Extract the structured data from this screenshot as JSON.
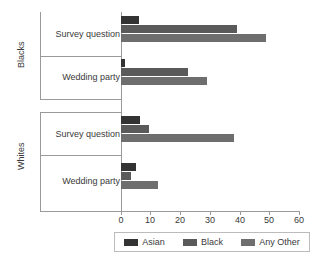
{
  "chart_data": {
    "type": "bar",
    "orientation": "horizontal",
    "title": "",
    "xlabel": "",
    "ylabel": "",
    "xlim": [
      0,
      60
    ],
    "xticks": [
      0,
      10,
      20,
      30,
      40,
      50,
      60
    ],
    "grid": false,
    "legend_position": "bottom",
    "outer_groups": [
      "Blacks",
      "Whites"
    ],
    "categories": [
      {
        "outer": "Blacks",
        "inner": "Survey question"
      },
      {
        "outer": "Blacks",
        "inner": "Wedding party"
      },
      {
        "outer": "Whites",
        "inner": "Survey question"
      },
      {
        "outer": "Whites",
        "inner": "Wedding party"
      }
    ],
    "series": [
      {
        "name": "Asian",
        "color": "#333333",
        "values": [
          6,
          1.5,
          6.5,
          5
        ]
      },
      {
        "name": "Black",
        "color": "#5a5a5a",
        "values": [
          39,
          22.5,
          9.5,
          3.5
        ]
      },
      {
        "name": "Any Other",
        "color": "#6e6e6e",
        "values": [
          49,
          29,
          38,
          12.5
        ]
      }
    ]
  },
  "axis": {
    "tick_labels": [
      "0",
      "10",
      "20",
      "30",
      "40",
      "50",
      "60"
    ]
  },
  "groups": [
    {
      "outer_label": "Blacks",
      "inner_label": "Survey question",
      "bars": [
        {
          "series": "Asian",
          "value": 6
        },
        {
          "series": "Black",
          "value": 39
        },
        {
          "series": "Any Other",
          "value": 49
        }
      ]
    },
    {
      "outer_label": "Blacks",
      "inner_label": "Wedding party",
      "bars": [
        {
          "series": "Asian",
          "value": 1.5
        },
        {
          "series": "Black",
          "value": 22.5
        },
        {
          "series": "Any Other",
          "value": 29
        }
      ]
    },
    {
      "outer_label": "Whites",
      "inner_label": "Survey question",
      "bars": [
        {
          "series": "Asian",
          "value": 6.5
        },
        {
          "series": "Black",
          "value": 9.5
        },
        {
          "series": "Any Other",
          "value": 38
        }
      ]
    },
    {
      "outer_label": "Whites",
      "inner_label": "Wedding party",
      "bars": [
        {
          "series": "Asian",
          "value": 5
        },
        {
          "series": "Black",
          "value": 3.5
        },
        {
          "series": "Any Other",
          "value": 12.5
        }
      ]
    }
  ],
  "legend": {
    "items": [
      {
        "label": "Asian",
        "color": "#333333"
      },
      {
        "label": "Black",
        "color": "#5a5a5a"
      },
      {
        "label": "Any Other",
        "color": "#6e6e6e"
      }
    ]
  }
}
